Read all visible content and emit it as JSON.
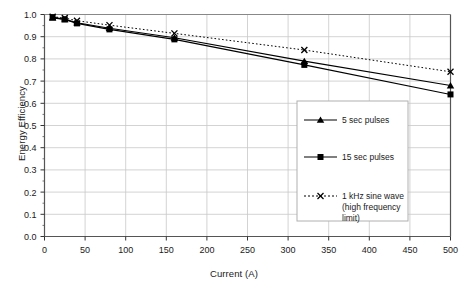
{
  "chart_data": {
    "type": "line",
    "title": "",
    "xlabel": "Current (A)",
    "ylabel": "Energy Efficiency",
    "xlim": [
      0,
      500
    ],
    "ylim": [
      0.0,
      1.0
    ],
    "xticks": [
      0,
      50,
      100,
      150,
      200,
      250,
      300,
      350,
      400,
      450,
      500
    ],
    "xtick_labels": [
      "0",
      "50",
      "100",
      "150",
      "200",
      "250",
      "300",
      "350",
      "400",
      "450",
      "500"
    ],
    "yticks": [
      0.0,
      0.1,
      0.2,
      0.3,
      0.4,
      0.5,
      0.6,
      0.7,
      0.8,
      0.9,
      1.0
    ],
    "ytick_labels": [
      "0.0",
      "0.1",
      "0.2",
      "0.3",
      "0.4",
      "0.5",
      "0.6",
      "0.7",
      "0.8",
      "0.9",
      "1.0"
    ],
    "grid": true,
    "grid_color": "#c8c8c8",
    "legend_position": "center-right-inside",
    "x": [
      10,
      25,
      40,
      80,
      160,
      320,
      500
    ],
    "series": [
      {
        "name": "5 sec pulses",
        "marker": "triangle",
        "linestyle": "solid",
        "color": "#000000",
        "values": [
          0.985,
          0.978,
          0.963,
          0.938,
          0.895,
          0.79,
          0.68
        ]
      },
      {
        "name": "15 sec pulses",
        "marker": "square",
        "linestyle": "solid",
        "color": "#000000",
        "values": [
          0.988,
          0.978,
          0.96,
          0.933,
          0.888,
          0.773,
          0.64
        ]
      },
      {
        "name": "1 kHz sine wave (high frequency limit)",
        "marker": "x",
        "linestyle": "dotted",
        "color": "#000000",
        "values": [
          0.99,
          0.984,
          0.972,
          0.952,
          0.915,
          0.84,
          0.742
        ]
      }
    ]
  },
  "legend": {
    "entries": [
      {
        "label": "5 sec pulses",
        "label2": ""
      },
      {
        "label": "15 sec pulses",
        "label2": ""
      },
      {
        "label": "1 kHz sine wave",
        "label2": "(high frequency",
        "label3": "limit)"
      }
    ]
  },
  "axes": {
    "x_title": "Current (A)",
    "y_title": "Energy Efficiency"
  }
}
